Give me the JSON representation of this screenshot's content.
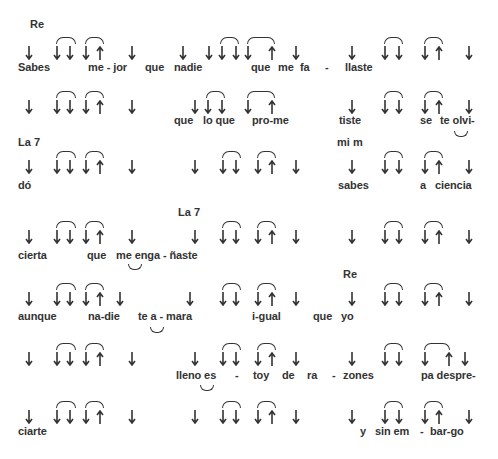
{
  "song": {
    "chords": [
      {
        "label": "Re",
        "x": 30,
        "y": 18
      },
      {
        "label": "La 7",
        "x": 18,
        "y": 136
      },
      {
        "label": "mi m",
        "x": 337,
        "y": 136
      },
      {
        "label": "La 7",
        "x": 178,
        "y": 206
      },
      {
        "label": "Re",
        "x": 343,
        "y": 268
      }
    ],
    "rows": [
      {
        "arrow_y": 46,
        "lyric_y": 61,
        "arrows": [
          {
            "d": "down",
            "x": 25
          },
          {
            "d": "down",
            "x": 53
          },
          {
            "d": "down",
            "x": 66
          },
          {
            "d": "down",
            "x": 82
          },
          {
            "d": "up",
            "x": 96
          },
          {
            "d": "down",
            "x": 128
          },
          {
            "d": "down",
            "x": 179
          },
          {
            "d": "down",
            "x": 205
          },
          {
            "d": "down",
            "x": 218
          },
          {
            "d": "down",
            "x": 232
          },
          {
            "d": "down",
            "x": 244
          },
          {
            "d": "up",
            "x": 268
          },
          {
            "d": "down",
            "x": 292
          },
          {
            "d": "down",
            "x": 348
          },
          {
            "d": "down",
            "x": 381
          },
          {
            "d": "down",
            "x": 395
          },
          {
            "d": "down",
            "x": 421
          },
          {
            "d": "up",
            "x": 435
          },
          {
            "d": "down",
            "x": 465
          }
        ],
        "arcs": [
          {
            "x": 56,
            "w": 18
          },
          {
            "x": 85,
            "w": 17
          },
          {
            "x": 220,
            "w": 17
          },
          {
            "x": 247,
            "w": 26
          },
          {
            "x": 384,
            "w": 17
          },
          {
            "x": 424,
            "w": 17
          }
        ],
        "under_arcs": [],
        "lyrics": [
          {
            "text": "Sabes",
            "x": 18
          },
          {
            "text": "me - jor",
            "x": 88
          },
          {
            "text": "que",
            "x": 145
          },
          {
            "text": "nadie",
            "x": 174
          },
          {
            "text": "que",
            "x": 251
          },
          {
            "text": "me",
            "x": 278
          },
          {
            "text": "fa",
            "x": 300
          },
          {
            "text": "-",
            "x": 325
          },
          {
            "text": "llaste",
            "x": 345
          }
        ]
      },
      {
        "arrow_y": 100,
        "lyric_y": 114,
        "arrows": [
          {
            "d": "down",
            "x": 25
          },
          {
            "d": "down",
            "x": 53
          },
          {
            "d": "down",
            "x": 66
          },
          {
            "d": "down",
            "x": 82
          },
          {
            "d": "up",
            "x": 96
          },
          {
            "d": "down",
            "x": 128
          },
          {
            "d": "down",
            "x": 191
          },
          {
            "d": "down",
            "x": 204
          },
          {
            "d": "down",
            "x": 218
          },
          {
            "d": "down",
            "x": 244
          },
          {
            "d": "up",
            "x": 268
          },
          {
            "d": "down",
            "x": 348
          },
          {
            "d": "down",
            "x": 381
          },
          {
            "d": "down",
            "x": 395
          },
          {
            "d": "down",
            "x": 421
          },
          {
            "d": "up",
            "x": 435
          },
          {
            "d": "down",
            "x": 465
          }
        ],
        "arcs": [
          {
            "x": 56,
            "w": 18
          },
          {
            "x": 85,
            "w": 17
          },
          {
            "x": 206,
            "w": 17
          },
          {
            "x": 247,
            "w": 26
          },
          {
            "x": 384,
            "w": 17
          },
          {
            "x": 424,
            "w": 17
          }
        ],
        "under_arcs": [
          {
            "x": 454,
            "y": 131
          }
        ],
        "lyrics": [
          {
            "text": "que",
            "x": 174
          },
          {
            "text": "lo que",
            "x": 203
          },
          {
            "text": "pro-me",
            "x": 252
          },
          {
            "text": "tiste",
            "x": 339
          },
          {
            "text": "se",
            "x": 420
          },
          {
            "text": "te olvi-",
            "x": 440
          }
        ]
      },
      {
        "arrow_y": 160,
        "lyric_y": 179,
        "arrows": [
          {
            "d": "down",
            "x": 25
          },
          {
            "d": "down",
            "x": 53
          },
          {
            "d": "down",
            "x": 66
          },
          {
            "d": "down",
            "x": 82
          },
          {
            "d": "up",
            "x": 96
          },
          {
            "d": "down",
            "x": 128
          },
          {
            "d": "down",
            "x": 191
          },
          {
            "d": "down",
            "x": 219
          },
          {
            "d": "down",
            "x": 232
          },
          {
            "d": "down",
            "x": 254
          },
          {
            "d": "up",
            "x": 268
          },
          {
            "d": "down",
            "x": 292
          },
          {
            "d": "down",
            "x": 348
          },
          {
            "d": "down",
            "x": 381
          },
          {
            "d": "down",
            "x": 395
          },
          {
            "d": "down",
            "x": 421
          },
          {
            "d": "up",
            "x": 435
          },
          {
            "d": "down",
            "x": 465
          }
        ],
        "arcs": [
          {
            "x": 56,
            "w": 18
          },
          {
            "x": 85,
            "w": 17
          },
          {
            "x": 222,
            "w": 17
          },
          {
            "x": 257,
            "w": 17
          },
          {
            "x": 384,
            "w": 17
          },
          {
            "x": 424,
            "w": 17
          }
        ],
        "under_arcs": [],
        "lyrics": [
          {
            "text": "dó",
            "x": 18
          },
          {
            "text": "sabes",
            "x": 338
          },
          {
            "text": "a",
            "x": 420
          },
          {
            "text": "ciencia",
            "x": 435
          }
        ]
      },
      {
        "arrow_y": 230,
        "lyric_y": 249,
        "arrows": [
          {
            "d": "down",
            "x": 25
          },
          {
            "d": "down",
            "x": 53
          },
          {
            "d": "down",
            "x": 66
          },
          {
            "d": "down",
            "x": 82
          },
          {
            "d": "up",
            "x": 96
          },
          {
            "d": "down",
            "x": 128
          },
          {
            "d": "down",
            "x": 191
          },
          {
            "d": "down",
            "x": 219
          },
          {
            "d": "down",
            "x": 232
          },
          {
            "d": "down",
            "x": 254
          },
          {
            "d": "up",
            "x": 268
          },
          {
            "d": "down",
            "x": 292
          },
          {
            "d": "down",
            "x": 348
          },
          {
            "d": "down",
            "x": 381
          },
          {
            "d": "down",
            "x": 395
          },
          {
            "d": "down",
            "x": 421
          },
          {
            "d": "up",
            "x": 435
          },
          {
            "d": "down",
            "x": 465
          }
        ],
        "arcs": [
          {
            "x": 56,
            "w": 18
          },
          {
            "x": 85,
            "w": 17
          },
          {
            "x": 222,
            "w": 17
          },
          {
            "x": 257,
            "w": 17
          },
          {
            "x": 384,
            "w": 17
          },
          {
            "x": 424,
            "w": 17
          }
        ],
        "under_arcs": [
          {
            "x": 128,
            "y": 264
          }
        ],
        "lyrics": [
          {
            "text": "cierta",
            "x": 18
          },
          {
            "text": "que",
            "x": 87
          },
          {
            "text": "me enga - ñaste",
            "x": 116
          }
        ]
      },
      {
        "arrow_y": 292,
        "lyric_y": 310,
        "arrows": [
          {
            "d": "down",
            "x": 25
          },
          {
            "d": "down",
            "x": 53
          },
          {
            "d": "down",
            "x": 66
          },
          {
            "d": "down",
            "x": 82
          },
          {
            "d": "up",
            "x": 96
          },
          {
            "d": "down",
            "x": 116
          },
          {
            "d": "down",
            "x": 186
          },
          {
            "d": "down",
            "x": 219
          },
          {
            "d": "down",
            "x": 232
          },
          {
            "d": "down",
            "x": 254
          },
          {
            "d": "up",
            "x": 268
          },
          {
            "d": "down",
            "x": 292
          },
          {
            "d": "down",
            "x": 348
          },
          {
            "d": "down",
            "x": 381
          },
          {
            "d": "down",
            "x": 395
          },
          {
            "d": "down",
            "x": 421
          },
          {
            "d": "up",
            "x": 435
          },
          {
            "d": "down",
            "x": 465
          }
        ],
        "arcs": [
          {
            "x": 56,
            "w": 18
          },
          {
            "x": 85,
            "w": 17
          },
          {
            "x": 222,
            "w": 17
          },
          {
            "x": 257,
            "w": 17
          },
          {
            "x": 384,
            "w": 17
          },
          {
            "x": 424,
            "w": 17
          }
        ],
        "under_arcs": [
          {
            "x": 150,
            "y": 327
          }
        ],
        "lyrics": [
          {
            "text": "aunque",
            "x": 18
          },
          {
            "text": "na-die",
            "x": 88
          },
          {
            "text": "te a - mara",
            "x": 138
          },
          {
            "text": "i-gual",
            "x": 252
          },
          {
            "text": "que",
            "x": 313
          },
          {
            "text": "yo",
            "x": 341
          }
        ]
      },
      {
        "arrow_y": 352,
        "lyric_y": 369,
        "arrows": [
          {
            "d": "down",
            "x": 25
          },
          {
            "d": "down",
            "x": 53
          },
          {
            "d": "down",
            "x": 66
          },
          {
            "d": "down",
            "x": 82
          },
          {
            "d": "up",
            "x": 96
          },
          {
            "d": "down",
            "x": 128
          },
          {
            "d": "down",
            "x": 191
          },
          {
            "d": "down",
            "x": 219
          },
          {
            "d": "down",
            "x": 232
          },
          {
            "d": "down",
            "x": 254
          },
          {
            "d": "up",
            "x": 268
          },
          {
            "d": "down",
            "x": 292
          },
          {
            "d": "down",
            "x": 348
          },
          {
            "d": "down",
            "x": 381
          },
          {
            "d": "down",
            "x": 395
          },
          {
            "d": "down",
            "x": 421
          },
          {
            "d": "up",
            "x": 445
          },
          {
            "d": "down",
            "x": 461
          }
        ],
        "arcs": [
          {
            "x": 56,
            "w": 18
          },
          {
            "x": 85,
            "w": 17
          },
          {
            "x": 222,
            "w": 17
          },
          {
            "x": 257,
            "w": 17
          },
          {
            "x": 384,
            "w": 17
          },
          {
            "x": 424,
            "w": 24
          }
        ],
        "under_arcs": [
          {
            "x": 200,
            "y": 385
          }
        ],
        "lyrics": [
          {
            "text": "lleno es",
            "x": 176
          },
          {
            "text": "-",
            "x": 235
          },
          {
            "text": "toy",
            "x": 253
          },
          {
            "text": "de",
            "x": 282
          },
          {
            "text": "ra",
            "x": 307
          },
          {
            "text": "-",
            "x": 332
          },
          {
            "text": "zones",
            "x": 343
          },
          {
            "text": "pa despre-",
            "x": 421
          }
        ]
      },
      {
        "arrow_y": 410,
        "lyric_y": 425,
        "arrows": [
          {
            "d": "down",
            "x": 25
          },
          {
            "d": "down",
            "x": 53
          },
          {
            "d": "down",
            "x": 66
          },
          {
            "d": "down",
            "x": 82
          },
          {
            "d": "up",
            "x": 96
          },
          {
            "d": "down",
            "x": 128
          },
          {
            "d": "down",
            "x": 191
          },
          {
            "d": "down",
            "x": 219
          },
          {
            "d": "down",
            "x": 232
          },
          {
            "d": "down",
            "x": 254
          },
          {
            "d": "up",
            "x": 268
          },
          {
            "d": "down",
            "x": 292
          },
          {
            "d": "down",
            "x": 348
          },
          {
            "d": "down",
            "x": 381
          },
          {
            "d": "down",
            "x": 395
          },
          {
            "d": "down",
            "x": 421
          },
          {
            "d": "up",
            "x": 435
          },
          {
            "d": "down",
            "x": 465
          }
        ],
        "arcs": [
          {
            "x": 56,
            "w": 18
          },
          {
            "x": 85,
            "w": 17
          },
          {
            "x": 222,
            "w": 17
          },
          {
            "x": 257,
            "w": 17
          },
          {
            "x": 384,
            "w": 17
          },
          {
            "x": 424,
            "w": 17
          }
        ],
        "under_arcs": [],
        "lyrics": [
          {
            "text": "ciarte",
            "x": 18
          },
          {
            "text": "y",
            "x": 360
          },
          {
            "text": "sin em",
            "x": 375
          },
          {
            "text": "-",
            "x": 420
          },
          {
            "text": "bar-go",
            "x": 430
          }
        ]
      }
    ]
  }
}
